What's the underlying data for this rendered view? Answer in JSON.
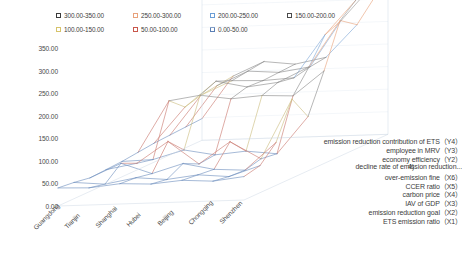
{
  "chart_data": {
    "type": "line",
    "subtype": "3d-wireframe-surface",
    "title": "",
    "xlabel": "",
    "ylabel": "",
    "zlabel": "",
    "ylim": [
      0,
      350
    ],
    "grid": true,
    "legend_position": "top",
    "y_ticks": [
      "0.00",
      "50.00",
      "100.00",
      "150.00",
      "200.00",
      "250.00",
      "300.00",
      "350.00"
    ],
    "y_tick_values": [
      0,
      50,
      100,
      150,
      200,
      250,
      300,
      350
    ],
    "categories": [
      "Guangdong",
      "Tianjin",
      "Shanghai",
      "Hubei",
      "Beijing",
      "Chongqing",
      "Shenzhen"
    ],
    "legend": [
      {
        "label": "300.00-350.00",
        "color": "#3b3b3b"
      },
      {
        "label": "250.00-300.00",
        "color": "#e8a27c"
      },
      {
        "label": "200.00-250.00",
        "color": "#6b9ed6"
      },
      {
        "label": "150.00-200.00",
        "color": "#4a4a4a"
      },
      {
        "label": "100.00-150.00",
        "color": "#d6c36b"
      },
      {
        "label": "50.00-100.00",
        "color": "#c9564b"
      },
      {
        "label": "0.00-50.00",
        "color": "#5b7fb5"
      }
    ],
    "series": [
      {
        "name": "ETS emission ratio（X1）",
        "values": [
          40,
          38,
          45,
          42,
          48,
          44,
          52
        ]
      },
      {
        "name": "emission reduction goal（X2）",
        "values": [
          36,
          30,
          42,
          36,
          44,
          38,
          60
        ]
      },
      {
        "name": "IAV of GDP（X3）",
        "values": [
          30,
          60,
          35,
          55,
          40,
          36,
          95
        ]
      },
      {
        "name": "carbon price（X4）",
        "values": [
          32,
          44,
          90,
          38,
          85,
          45,
          175
        ]
      },
      {
        "name": "CCER ratio（X5）",
        "values": [
          34,
          36,
          55,
          42,
          48,
          40,
          120
        ]
      },
      {
        "name": "over-emission fine（X6）",
        "values": [
          38,
          150,
          160,
          150,
          155,
          152,
          205
        ]
      },
      {
        "name": "decline rate of emission reduction...",
        "values": [
          42,
          120,
          175,
          160,
          168,
          200,
          300
        ]
      },
      {
        "name": "economy efficiency（Y2）",
        "values": [
          44,
          130,
          160,
          158,
          162,
          255,
          330
        ]
      },
      {
        "name": "employee in MRV（Y3）",
        "values": [
          46,
          135,
          165,
          160,
          170,
          270,
          345
        ]
      },
      {
        "name": "emission reduction contribution of ETS（Y4）",
        "values": [
          48,
          140,
          170,
          162,
          175,
          245,
          350
        ]
      }
    ],
    "stray_fragment": "4)"
  }
}
